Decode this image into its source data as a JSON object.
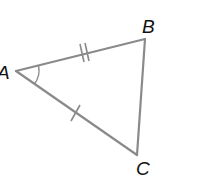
{
  "diagram": {
    "type": "triangle",
    "stroke_color": "#8a8a8a",
    "label_color": "#111111",
    "vertices": {
      "A": {
        "label": "A",
        "x": 16,
        "y": 71
      },
      "B": {
        "label": "B",
        "x": 145,
        "y": 39
      },
      "C": {
        "label": "C",
        "x": 137,
        "y": 155
      }
    },
    "sides": [
      {
        "from": "A",
        "to": "B",
        "tick_marks": 2
      },
      {
        "from": "A",
        "to": "C",
        "tick_marks": 1
      },
      {
        "from": "B",
        "to": "C",
        "tick_marks": 0
      }
    ],
    "angle_marks": [
      {
        "vertex": "A",
        "arcs": 1
      }
    ],
    "labels": {
      "a": "A",
      "b": "B",
      "c": "C"
    }
  }
}
